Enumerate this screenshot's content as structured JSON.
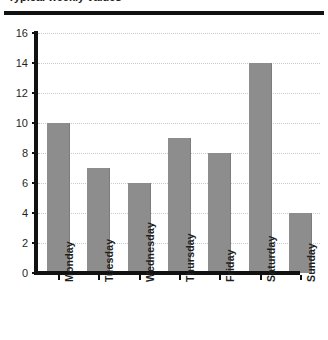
{
  "header": {
    "clipped_title": "Typical weekly values",
    "rule_color": "#111111"
  },
  "chart_data": {
    "type": "bar",
    "title": "",
    "xlabel": "",
    "ylabel": "",
    "categories": [
      "Monday",
      "Tuesday",
      "Wednesday",
      "Thursday",
      "Friday",
      "Saturday",
      "Sunday"
    ],
    "values": [
      10,
      7,
      6,
      9,
      8,
      14,
      4
    ],
    "ylim": [
      0,
      16
    ],
    "ytick_step": 2,
    "yticks": [
      0,
      2,
      4,
      6,
      8,
      10,
      12,
      14,
      16
    ],
    "ytick_labels": [
      "0",
      "2",
      "4",
      "6",
      "8",
      "10",
      "12",
      "14",
      "16"
    ],
    "grid": true,
    "grid_axis": "y",
    "grid_style": "dotted",
    "grid_color": "#c9c9c9",
    "bar_color": "#8d8d8d",
    "axis_color": "#111111",
    "legend": false,
    "xtick_label_rotation": -90
  }
}
